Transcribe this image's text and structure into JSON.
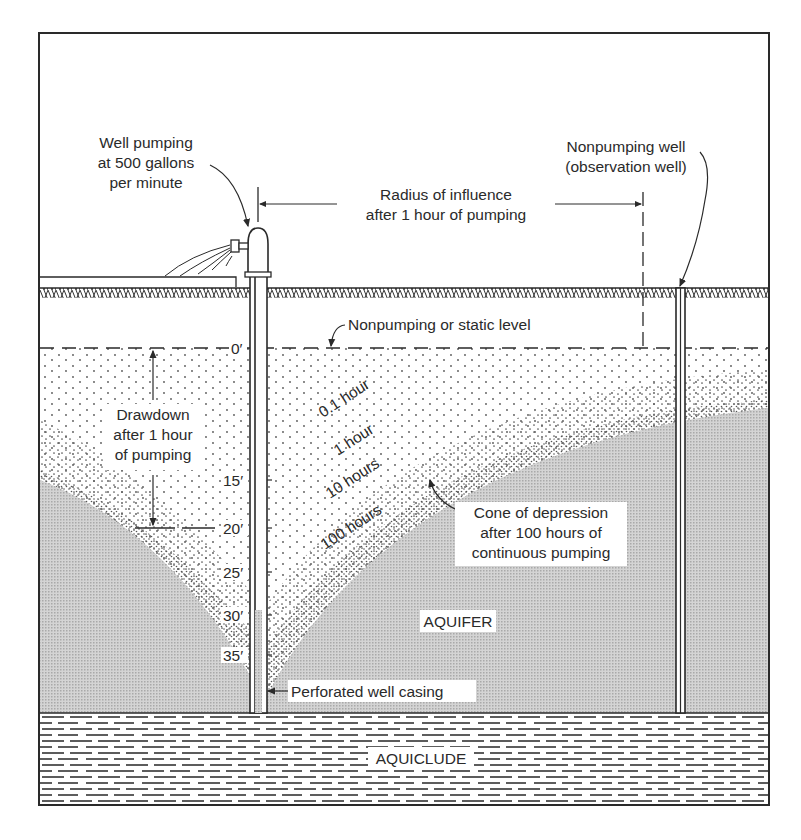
{
  "diagram": {
    "type": "cross-section",
    "colors": {
      "ink": "#2a2a2a",
      "aquifer_fill": "#c9c9c9",
      "background": "#ffffff"
    },
    "labels": {
      "pumping_well_line1": "Well pumping",
      "pumping_well_line2": "at 500 gallons",
      "pumping_well_line3": "per minute",
      "radius_line1": "Radius of influence",
      "radius_line2": "after 1 hour of pumping",
      "observation_well_line1": "Nonpumping well",
      "observation_well_line2": "(observation well)",
      "static_level": "Nonpumping or static level",
      "drawdown_line1": "Drawdown",
      "drawdown_line2": "after 1 hour",
      "drawdown_line3": "of pumping",
      "cone_line1": "Cone of depression",
      "cone_line2": "after 100 hours of",
      "cone_line3": "continuous pumping",
      "aquifer": "AQUIFER",
      "aquiclude": "AQUICLUDE",
      "perforated_casing": "Perforated well casing"
    },
    "depth_scale": [
      "0′",
      "15′",
      "20′",
      "25′",
      "30′",
      "35′"
    ],
    "cone_curves": [
      {
        "label": "0.1 hour"
      },
      {
        "label": "1 hour"
      },
      {
        "label": "10 hours"
      },
      {
        "label": "100 hours"
      }
    ]
  }
}
